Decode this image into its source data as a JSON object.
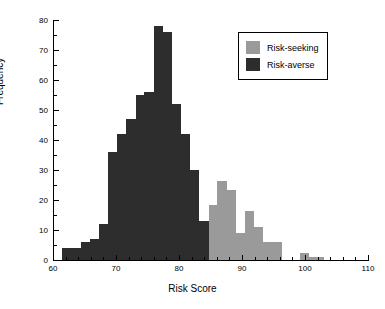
{
  "chart_data": {
    "type": "bar",
    "title": "",
    "xlabel": "Risk Score",
    "ylabel": "Frequency",
    "xlim": [
      60,
      110
    ],
    "ylim": [
      0,
      80
    ],
    "xticks": [
      60,
      70,
      80,
      90,
      100,
      110
    ],
    "yticks": [
      0,
      10,
      20,
      30,
      40,
      50,
      60,
      70,
      80
    ],
    "xtick_labels": [
      "60",
      "70",
      "80",
      "90",
      "100",
      "110"
    ],
    "ytick_labels": [
      "0",
      "10",
      "20",
      "30",
      "40",
      "50",
      "60",
      "70",
      "80"
    ],
    "minor_tick_step_x": 2,
    "minor_tick_step_y": 5,
    "grid": false,
    "bin_width": 1.45,
    "legend_position": "top-right",
    "colors": {
      "risk_seeking": "#9a9a9a",
      "risk_averse": "#2d2d2d",
      "axis": "#000000",
      "background": "#ffffff"
    },
    "series": [
      {
        "name": "Risk-averse",
        "color": "#2d2d2d",
        "bins": [
          {
            "x0": 61.5,
            "x1": 62.9,
            "value": 4
          },
          {
            "x0": 62.9,
            "x1": 64.4,
            "value": 4
          },
          {
            "x0": 64.4,
            "x1": 65.8,
            "value": 6
          },
          {
            "x0": 65.8,
            "x1": 67.3,
            "value": 7
          },
          {
            "x0": 67.3,
            "x1": 68.7,
            "value": 12
          },
          {
            "x0": 68.7,
            "x1": 70.2,
            "value": 36
          },
          {
            "x0": 70.2,
            "x1": 71.6,
            "value": 42
          },
          {
            "x0": 71.6,
            "x1": 73.1,
            "value": 47
          },
          {
            "x0": 73.1,
            "x1": 74.5,
            "value": 55
          },
          {
            "x0": 74.5,
            "x1": 76.0,
            "value": 56
          },
          {
            "x0": 76.0,
            "x1": 77.4,
            "value": 78
          },
          {
            "x0": 77.4,
            "x1": 78.9,
            "value": 76
          },
          {
            "x0": 78.9,
            "x1": 80.3,
            "value": 52
          },
          {
            "x0": 80.3,
            "x1": 81.8,
            "value": 42
          },
          {
            "x0": 81.8,
            "x1": 83.2,
            "value": 30
          },
          {
            "x0": 83.2,
            "x1": 84.7,
            "value": 13
          }
        ]
      },
      {
        "name": "Risk-seeking",
        "color": "#9a9a9a",
        "bins": [
          {
            "x0": 84.7,
            "x1": 86.1,
            "value": 18.5
          },
          {
            "x0": 86.1,
            "x1": 87.6,
            "value": 26.5
          },
          {
            "x0": 87.6,
            "x1": 89.0,
            "value": 23.5
          },
          {
            "x0": 89.0,
            "x1": 90.5,
            "value": 9
          },
          {
            "x0": 90.5,
            "x1": 91.9,
            "value": 16.5
          },
          {
            "x0": 91.9,
            "x1": 93.4,
            "value": 11
          },
          {
            "x0": 93.4,
            "x1": 94.8,
            "value": 6
          },
          {
            "x0": 94.8,
            "x1": 96.3,
            "value": 6
          },
          {
            "x0": 96.3,
            "x1": 97.7,
            "value": 0
          },
          {
            "x0": 97.7,
            "x1": 99.2,
            "value": 0
          },
          {
            "x0": 99.2,
            "x1": 100.6,
            "value": 2.5
          },
          {
            "x0": 100.6,
            "x1": 102.1,
            "value": 1
          },
          {
            "x0": 102.1,
            "x1": 103.0,
            "value": 1
          }
        ]
      }
    ]
  },
  "legend": {
    "entries": [
      {
        "label": "Risk-seeking",
        "color": "#9a9a9a"
      },
      {
        "label": "Risk-averse",
        "color": "#2d2d2d"
      }
    ]
  }
}
